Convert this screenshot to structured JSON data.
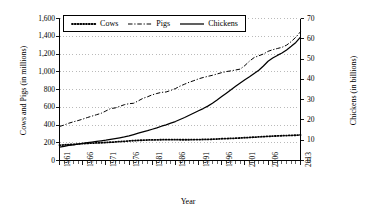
{
  "chart_data": {
    "type": "line",
    "title": "",
    "xlabel": "Year",
    "ylabel": "Cows and Pigs (in millions)",
    "y2label": "Chickens (in billions)",
    "grid": true,
    "legend_position": "top-center-inside",
    "xlim": [
      1961,
      2013
    ],
    "ylim": [
      0,
      1600
    ],
    "y2lim": [
      0,
      70
    ],
    "y_ticks": [
      "0",
      "200",
      "400",
      "600",
      "800",
      "1,000",
      "1,200",
      "1,400",
      "1,600"
    ],
    "y_tick_values": [
      0,
      200,
      400,
      600,
      800,
      1000,
      1200,
      1400,
      1600
    ],
    "y2_ticks": [
      "0",
      "10",
      "20",
      "30",
      "40",
      "50",
      "60",
      "70"
    ],
    "y2_tick_values": [
      0,
      10,
      20,
      30,
      40,
      50,
      60,
      70
    ],
    "x_ticks": [
      "1961",
      "1966",
      "1971",
      "1976",
      "1981",
      "1986",
      "1991",
      "1996",
      "2001",
      "2006",
      "2013"
    ],
    "x_tick_values": [
      1961,
      1966,
      1971,
      1976,
      1981,
      1986,
      1991,
      1996,
      2001,
      2006,
      2013
    ],
    "x": [
      1961,
      1962,
      1963,
      1964,
      1965,
      1966,
      1967,
      1968,
      1969,
      1970,
      1971,
      1972,
      1973,
      1974,
      1975,
      1976,
      1977,
      1978,
      1979,
      1980,
      1981,
      1982,
      1983,
      1984,
      1985,
      1986,
      1987,
      1988,
      1989,
      1990,
      1991,
      1992,
      1993,
      1994,
      1995,
      1996,
      1997,
      1998,
      1999,
      2000,
      2001,
      2002,
      2003,
      2004,
      2005,
      2006,
      2007,
      2008,
      2009,
      2010,
      2011,
      2012,
      2013
    ],
    "series": [
      {
        "name": "Cows",
        "axis": "left",
        "unit": "millions",
        "style": "dotted",
        "values": [
          172,
          176,
          179,
          182,
          186,
          190,
          193,
          196,
          198,
          200,
          203,
          206,
          209,
          213,
          216,
          220,
          224,
          227,
          229,
          231,
          232,
          233,
          234,
          235,
          235,
          235,
          234,
          234,
          234,
          235,
          236,
          237,
          238,
          240,
          242,
          245,
          247,
          249,
          251,
          254,
          257,
          260,
          263,
          266,
          269,
          272,
          275,
          277,
          279,
          281,
          283,
          285,
          288
        ]
      },
      {
        "name": "Pigs",
        "axis": "left",
        "unit": "millions",
        "style": "dash-dot",
        "values": [
          383,
          400,
          420,
          436,
          450,
          466,
          484,
          500,
          516,
          532,
          558,
          585,
          592,
          610,
          629,
          640,
          645,
          672,
          700,
          718,
          740,
          755,
          768,
          772,
          790,
          810,
          838,
          860,
          882,
          900,
          920,
          935,
          948,
          960,
          975,
          990,
          1002,
          1010,
          1020,
          1030,
          1070,
          1120,
          1160,
          1180,
          1200,
          1230,
          1248,
          1262,
          1275,
          1300,
          1340,
          1390,
          1450
        ]
      },
      {
        "name": "Chickens",
        "axis": "right",
        "unit": "billions",
        "style": "solid",
        "values": [
          6.6,
          7.0,
          7.4,
          7.7,
          8.1,
          8.5,
          8.8,
          9.1,
          9.4,
          9.7,
          10.0,
          10.4,
          10.8,
          11.2,
          11.6,
          12.1,
          12.8,
          13.5,
          14.1,
          14.7,
          15.4,
          16.1,
          16.9,
          17.6,
          18.4,
          19.2,
          20.2,
          21.2,
          22.3,
          23.4,
          24.5,
          25.6,
          26.8,
          28.2,
          29.8,
          31.5,
          33.2,
          34.9,
          36.6,
          38.2,
          39.8,
          41.3,
          42.9,
          44.5,
          46.6,
          48.9,
          50.5,
          51.8,
          53.0,
          54.5,
          56.3,
          58.2,
          60.8
        ]
      }
    ]
  },
  "legend": {
    "items": [
      {
        "label": "Cows",
        "style": "dotted"
      },
      {
        "label": "Pigs",
        "style": "dash-dot"
      },
      {
        "label": "Chickens",
        "style": "solid"
      }
    ]
  }
}
